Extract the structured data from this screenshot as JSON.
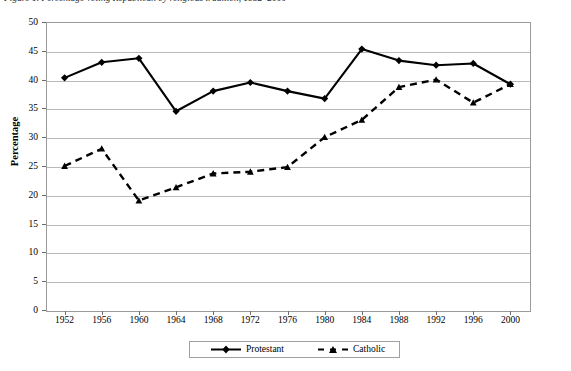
{
  "figure": {
    "caption": "Figure 1.  Percentage voting Republican by religious tradition, 1952–2000"
  },
  "chart_data": {
    "type": "line",
    "title": "",
    "xlabel": "",
    "ylabel": "Percentage",
    "categories": [
      "1952",
      "1956",
      "1960",
      "1964",
      "1968",
      "1972",
      "1976",
      "1980",
      "1984",
      "1988",
      "1992",
      "1996",
      "2000"
    ],
    "x": [
      1952,
      1956,
      1960,
      1964,
      1968,
      1972,
      1976,
      1980,
      1984,
      1988,
      1992,
      1996,
      2000
    ],
    "ylim": [
      0,
      50
    ],
    "yticks": [
      0,
      5,
      10,
      15,
      20,
      25,
      30,
      35,
      40,
      45,
      50
    ],
    "grid": "horizontal",
    "legend_position": "bottom",
    "series": [
      {
        "name": "Protestant",
        "marker": "diamond",
        "linestyle": "solid",
        "color": "#000000",
        "values": [
          40.3,
          43.0,
          43.7,
          34.5,
          38.0,
          39.5,
          38.0,
          36.7,
          45.3,
          43.3,
          42.5,
          42.8,
          39.2
        ]
      },
      {
        "name": "Catholic",
        "marker": "triangle",
        "linestyle": "dashed",
        "color": "#000000",
        "values": [
          25.0,
          28.0,
          19.0,
          21.3,
          23.7,
          24.0,
          24.8,
          30.0,
          33.0,
          38.7,
          40.0,
          36.0,
          39.2
        ]
      }
    ]
  },
  "legend": {
    "entries": [
      {
        "label": "Protestant"
      },
      {
        "label": "Catholic"
      }
    ]
  }
}
